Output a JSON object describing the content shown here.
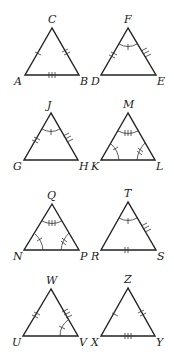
{
  "figure": {
    "triangles": [
      {
        "id": "ABC",
        "vertices": {
          "top": "C",
          "left": "A",
          "right": "B"
        },
        "marks": {
          "left_side": "1 tick",
          "right_side": "2 ticks",
          "base": "3 ticks"
        }
      },
      {
        "id": "DEF",
        "vertices": {
          "top": "F",
          "left": "D",
          "right": "E"
        },
        "marks": {
          "left_side": "2 ticks",
          "right_side": "3 ticks",
          "top_angle": "1 tick arc"
        }
      },
      {
        "id": "GHJ",
        "vertices": {
          "top": "J",
          "left": "G",
          "right": "H"
        },
        "marks": {
          "left_side": "2 ticks",
          "right_side": "3 ticks",
          "top_angle": "1 tick arc"
        }
      },
      {
        "id": "KLM",
        "vertices": {
          "top": "M",
          "left": "K",
          "right": "L"
        },
        "marks": {
          "top_angle": "3 tick arc",
          "left_angle": "1 tick arc",
          "right_angle": "2 tick arc"
        }
      },
      {
        "id": "NPQ",
        "vertices": {
          "top": "Q",
          "left": "N",
          "right": "P"
        },
        "marks": {
          "top_angle": "3 tick arc",
          "left_angle": "1 tick arc",
          "right_angle": "2 tick arc"
        }
      },
      {
        "id": "RST",
        "vertices": {
          "top": "T",
          "left": "R",
          "right": "S"
        },
        "marks": {
          "right_side": "3 ticks",
          "base": "2 ticks",
          "top_angle": "1 tick arc"
        }
      },
      {
        "id": "UVW",
        "vertices": {
          "top": "W",
          "left": "U",
          "right": "V"
        },
        "marks": {
          "left_side": "2 ticks",
          "right_side": "3 ticks",
          "right_angle": "1 tick arc"
        }
      },
      {
        "id": "XYZ",
        "vertices": {
          "top": "Z",
          "left": "X",
          "right": "Y"
        },
        "marks": {
          "left_side": "1 tick",
          "right_side": "2 ticks",
          "base": "3 ticks"
        }
      }
    ]
  },
  "labels": {
    "t1": {
      "top": "C",
      "left": "A",
      "right": "B"
    },
    "t2": {
      "top": "F",
      "left": "D",
      "right": "E"
    },
    "t3": {
      "top": "J",
      "left": "G",
      "right": "H"
    },
    "t4": {
      "top": "M",
      "left": "K",
      "right": "L"
    },
    "t5": {
      "top": "Q",
      "left": "N",
      "right": "P"
    },
    "t6": {
      "top": "T",
      "left": "R",
      "right": "S"
    },
    "t7": {
      "top": "W",
      "left": "U",
      "right": "V"
    },
    "t8": {
      "top": "Z",
      "left": "X",
      "right": "Y"
    }
  }
}
